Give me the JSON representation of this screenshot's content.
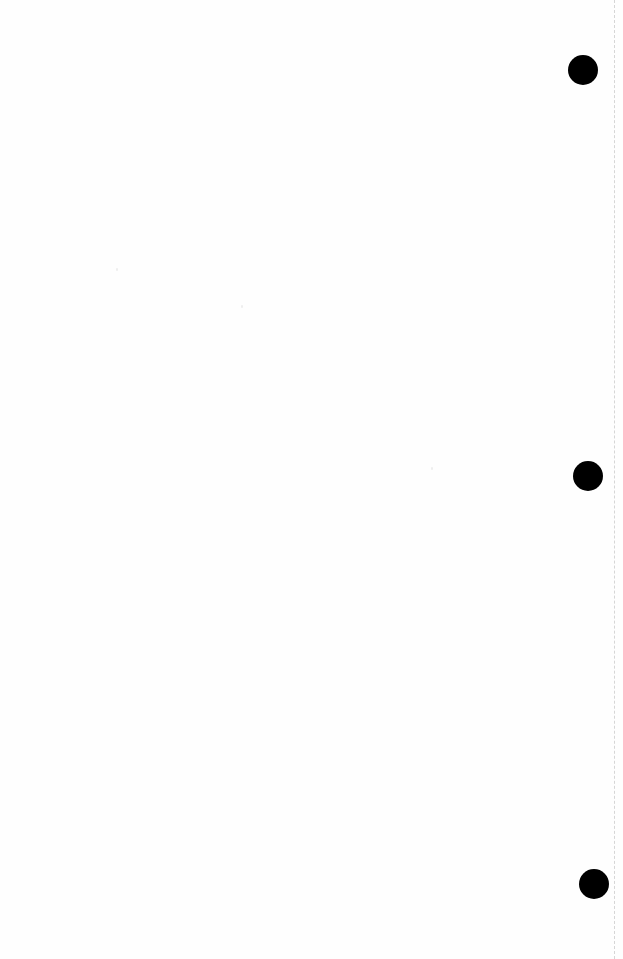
{
  "page": {
    "type": "blank scanned sheet",
    "background_color": "#fefefe",
    "text": ""
  },
  "punch_holes": [
    {
      "cx": 583,
      "cy": 70,
      "diameter": 30,
      "color": "#000000"
    },
    {
      "cx": 588,
      "cy": 476,
      "diameter": 30,
      "color": "#000000"
    },
    {
      "cx": 594,
      "cy": 884,
      "diameter": 30,
      "color": "#000000"
    }
  ],
  "scan_edge": {
    "x": 614,
    "style": "dashed",
    "color": "#d6d6d6"
  }
}
